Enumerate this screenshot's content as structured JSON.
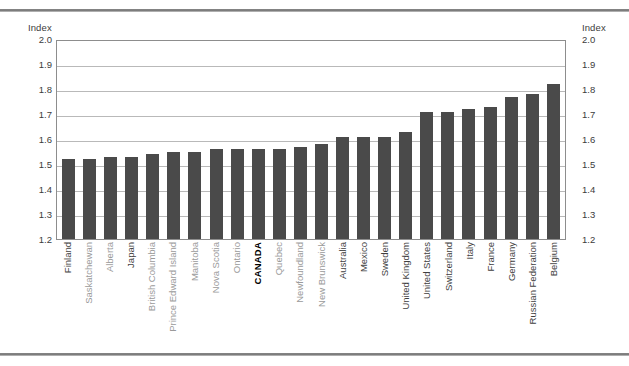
{
  "axis": {
    "left_caption": "Index",
    "right_caption": "Index",
    "ticks": [
      "2.0",
      "1.9",
      "1.8",
      "1.7",
      "1.6",
      "1.5",
      "1.4",
      "1.3",
      "1.2"
    ]
  },
  "colors": {
    "bar": "#4a4a4a",
    "grid": "#b9b9b9",
    "frame": "#8d8d8d",
    "label_region": "#9a9a9a",
    "label_country": "#3f3f3f",
    "label_highlight": "#000000"
  },
  "chart_data": {
    "type": "bar",
    "title": "",
    "xlabel": "",
    "ylabel": "Index",
    "ylim": [
      1.2,
      2.0
    ],
    "ytick_step": 0.1,
    "grid": true,
    "legend": "none",
    "categories": [
      "Finland",
      "Saskatchewan",
      "Alberta",
      "Japan",
      "British Columbia",
      "Prince Edward Island",
      "Manitoba",
      "Nova Scotia",
      "Ontario",
      "CANADA",
      "Quebec",
      "Newfoundland",
      "New Brunswick",
      "Australia",
      "Mexico",
      "Sweden",
      "United Kingdom",
      "United States",
      "Switzerland",
      "Italy",
      "France",
      "Germany",
      "Russian Federation",
      "Belgium"
    ],
    "values": [
      1.52,
      1.52,
      1.53,
      1.53,
      1.54,
      1.55,
      1.55,
      1.56,
      1.56,
      1.56,
      1.56,
      1.57,
      1.58,
      1.61,
      1.61,
      1.61,
      1.63,
      1.71,
      1.71,
      1.72,
      1.73,
      1.77,
      1.78,
      1.82
    ],
    "category_types": [
      "country",
      "region",
      "region",
      "country",
      "region",
      "region",
      "region",
      "region",
      "region",
      "highlight",
      "region",
      "region",
      "region",
      "country",
      "country",
      "country",
      "country",
      "country",
      "country",
      "country",
      "country",
      "country",
      "country",
      "country"
    ]
  }
}
